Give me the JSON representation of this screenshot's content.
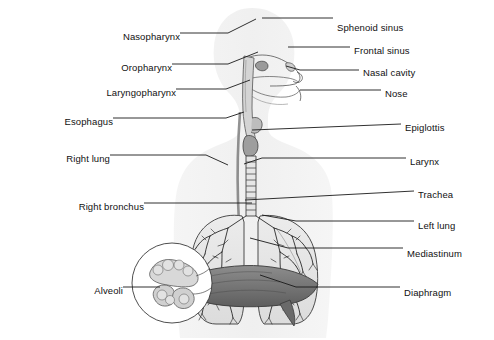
{
  "figure": {
    "background_color": "#ffffff",
    "line_color": "#1a1a1a",
    "body_silhouette_color": "#f0f0f0",
    "lung_fill_color": "#e8e8e8",
    "diaphragm_color": "#7a7a7a",
    "width": 494,
    "height": 340
  },
  "labels": {
    "left": [
      {
        "id": "nasopharynx",
        "text": "Nasopharynx",
        "text_x": 176,
        "text_y": 37,
        "line": "M180,33 L228,33 L256,19"
      },
      {
        "id": "oropharynx",
        "text": "Oropharynx",
        "text_x": 168,
        "text_y": 68,
        "line": "M172,64 L228,64 L258,52"
      },
      {
        "id": "laryngopharynx",
        "text": "Laryngopharynx",
        "text_x": 172,
        "text_y": 93,
        "line": "M176,89 L226,89 L250,80"
      },
      {
        "id": "esophagus",
        "text": "Esophagus",
        "text_x": 109,
        "text_y": 122,
        "line": "M113,118 L226,118 L244,112"
      },
      {
        "id": "right_lung",
        "text": "Right lung",
        "text_x": 106,
        "text_y": 159,
        "line": "M110,155 L206,155 L228,165"
      },
      {
        "id": "right_bronchus",
        "text": "Right bronchus",
        "text_x": 140,
        "text_y": 207,
        "line": "M144,203 L252,203"
      },
      {
        "id": "alveoli",
        "text": "Alveoli",
        "text_x": 119,
        "text_y": 291,
        "line": "M123,287 L160,287"
      }
    ],
    "right": [
      {
        "id": "sphenoid_sinus",
        "text": "Sphenoid sinus",
        "text_x": 337,
        "text_y": 28,
        "line": "M262,18 L333,18"
      },
      {
        "id": "frontal_sinus",
        "text": "Frontal sinus",
        "text_x": 354,
        "text_y": 51,
        "line": "M288,47 L350,47"
      },
      {
        "id": "nasal_cavity",
        "text": "Nasal cavity",
        "text_x": 363,
        "text_y": 73,
        "line": "M286,66 L300,70 L359,70"
      },
      {
        "id": "nose",
        "text": "Nose",
        "text_x": 385,
        "text_y": 94,
        "line": "M300,90 L381,90"
      },
      {
        "id": "epiglottis",
        "text": "Epiglottis",
        "text_x": 405,
        "text_y": 128,
        "line": "M252,130 L401,124"
      },
      {
        "id": "larynx",
        "text": "Larynx",
        "text_x": 410,
        "text_y": 162,
        "line": "M244,164 L262,158 L406,158"
      },
      {
        "id": "trachea",
        "text": "Trachea",
        "text_x": 418,
        "text_y": 195,
        "line": "M245,200 L414,191"
      },
      {
        "id": "left_lung",
        "text": "Left lung",
        "text_x": 418,
        "text_y": 226,
        "line": "M262,215 L296,221 L414,221"
      },
      {
        "id": "mediastinum",
        "text": "Mediastinum",
        "text_x": 407,
        "text_y": 254,
        "line": "M250,238 L288,248 L403,248"
      },
      {
        "id": "diaphragm",
        "text": "Diaphragm",
        "text_x": 404,
        "text_y": 293,
        "line": "M260,275 L296,287 L400,287"
      }
    ]
  }
}
